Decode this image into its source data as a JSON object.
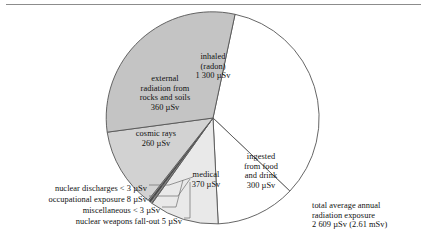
{
  "figure": {
    "units": "µSv",
    "total_label": "total average annual\nradiation exposure\n2 609 µSv (2.61 mSv)",
    "total_line1": "total average annual",
    "total_line2": "radiation exposure",
    "total_line3": "2 609 µSv (2.61 mSv)"
  },
  "labels": {
    "inhaled_l1": "inhaled",
    "inhaled_l2": "(radon)",
    "inhaled_l3": "1 300 µSv",
    "external_l1": "external",
    "external_l2": "radiation from",
    "external_l3": "rocks and soils",
    "external_l4": "360 µSv",
    "cosmic_l1": "cosmic rays",
    "cosmic_l2": "260 µSv",
    "medical_l1": "medical",
    "medical_l2": "370 µSv",
    "ingested_l1": "ingested",
    "ingested_l2": "from food",
    "ingested_l3": "and drink",
    "ingested_l4": "300 µSv",
    "nuclear_discharges": "nuclear discharges < 3 µSv",
    "occupational_exposure": "occupational exposure 8 µSv",
    "miscellaneous": "miscellaneous <  3 µSv",
    "nuclear_weapons_fallout": "nuclear weapons fall-out 5 µSv"
  },
  "chart_data": {
    "type": "pie",
    "title": "",
    "unit": "µSv",
    "total": 2609,
    "total_text": "2 609 µSv (2.61 mSv)",
    "legend": "inline-labels",
    "start_angle_deg": 12,
    "direction": "clockwise",
    "center": {
      "x": 213,
      "y": 118
    },
    "radius": 106,
    "categories": [
      "inhaled (radon)",
      "ingested from food and drink",
      "medical",
      "nuclear weapons fall-out",
      "miscellaneous",
      "occupational exposure",
      "nuclear discharges",
      "cosmic rays",
      "external radiation from rocks and soils"
    ],
    "values": [
      1300,
      300,
      370,
      5,
      3,
      8,
      3,
      260,
      360
    ],
    "value_texts": [
      "1 300 µSv",
      "300 µSv",
      "370 µSv",
      "5 µSv",
      "< 3 µSv",
      "8 µSv",
      "< 3 µSv",
      "260 µSv",
      "360 µSv"
    ],
    "colors": [
      "#ffffff",
      "#ffffff",
      "#e8e8e8",
      "#6b6b6b",
      "#c9c9c9",
      "#4a4a4a",
      "#a8a8a8",
      "#d2d2d2",
      "#c4c4c4"
    ],
    "stroke": "#555555",
    "grid": false
  },
  "slice_paths": {
    "inhaled": "M 213 118 L 235.04 14.30 A 106 106 0 0 1 289.90 191.08 Z",
    "ingested": "M 213 118 L 289.90 191.08 A 106 106 0 0 1 218.19 223.87 Z",
    "medical": "M 213 118 L 218.19 223.87 A 106 106 0 0 1 152.09 203.49 Z",
    "nwf": "M 213 118 L 152.09 203.49 A 106 106 0 0 1 151.04 202.68 Z",
    "misc": "M 213 118 L 151.04 202.68 A 106 106 0 0 1 150.41 202.18 Z",
    "occ": "M 213 118 L 150.41 202.18 A 106 106 0 0 1 148.74 200.82 Z",
    "nd": "M 213 118 L 148.74 200.82 A 106 106 0 0 1 148.11 200.29 Z",
    "cosmic": "M 213 118 L 148.11 200.29 A 106 106 0 0 1 107.18 132.18 Z",
    "external": "M 213 118 L 107.18 132.18 A 106 106 0 0 1 235.04 14.30 Z"
  },
  "leaders": {
    "nd": "M 149 185 L 169 185 L 193 177",
    "occ": "M 149 196 L 178 196 L 190 179",
    "misc": "M 162 207 L 176 207 L 183 180",
    "nwf": "M 184 218 L 190 218 L 190 182"
  }
}
